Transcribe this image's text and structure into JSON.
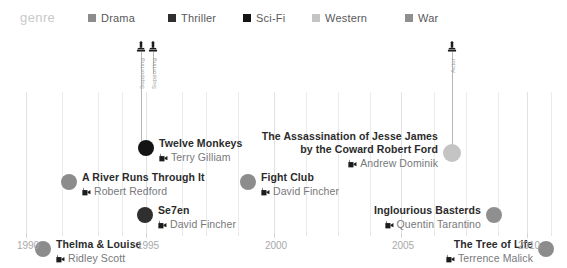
{
  "legend": {
    "title": "genre",
    "items": [
      {
        "label": "Drama",
        "color": "#8c8c8c",
        "x": 88
      },
      {
        "label": "Thriller",
        "color": "#2f2f2f",
        "x": 168
      },
      {
        "label": "Sci-Fi",
        "color": "#141414",
        "x": 243
      },
      {
        "label": "Western",
        "color": "#c4c4c4",
        "x": 312
      },
      {
        "label": "War",
        "color": "#8f8f8f",
        "x": 405
      }
    ]
  },
  "axis": {
    "label": "",
    "ticks": [
      {
        "label": "1990",
        "x": 26
      },
      {
        "label": "1995",
        "x": 146
      },
      {
        "label": "2000",
        "x": 274
      },
      {
        "label": "2005",
        "x": 401
      },
      {
        "label": "2010",
        "x": 527
      }
    ],
    "minor_x": [
      62,
      98,
      122,
      182,
      206,
      238,
      306,
      338,
      370,
      434,
      466,
      498,
      551
    ]
  },
  "chart_data": {
    "type": "scatter",
    "title": "",
    "xlabel": "",
    "ylabel": "",
    "xlim": [
      1990,
      2011
    ],
    "grid": true,
    "legend_position": "top",
    "films": [
      {
        "title": "Twelve Monkeys",
        "director": "Terry Gilliam",
        "genre": "Sci-Fi",
        "color": "#141414",
        "x": 146,
        "y": 114,
        "r": 8,
        "side": "right",
        "awards": [
          {
            "text": "Supporting",
            "x": 141,
            "stem_top": 18,
            "stem_bottom": 114
          },
          {
            "text": "Supporting",
            "x": 153,
            "stem_top": 18,
            "stem_bottom": 40
          }
        ]
      },
      {
        "title": "A River Runs Through It",
        "director": "Robert Redford",
        "genre": "Drama",
        "color": "#8c8c8c",
        "x": 69,
        "y": 148,
        "r": 8,
        "side": "right",
        "awards": []
      },
      {
        "title": "Se7en",
        "director": "David Fincher",
        "genre": "Thriller",
        "color": "#2f2f2f",
        "x": 145,
        "y": 181,
        "r": 8,
        "side": "right",
        "awards": []
      },
      {
        "title": "Thelma & Louise",
        "director": "Ridley Scott",
        "genre": "Drama",
        "color": "#8c8c8c",
        "x": 43,
        "y": 215,
        "r": 8,
        "side": "right",
        "awards": []
      },
      {
        "title": "Fight Club",
        "director": "David Fincher",
        "genre": "Drama",
        "color": "#8c8c8c",
        "x": 248,
        "y": 148,
        "r": 8,
        "side": "right",
        "awards": []
      },
      {
        "title": "The Assassination of Jesse James",
        "title2": "by the Coward Robert Ford",
        "director": "Andrew Dominik",
        "genre": "Western",
        "color": "#c4c4c4",
        "x": 452,
        "y": 119,
        "r": 9,
        "side": "left",
        "awards": [
          {
            "text": "Actor",
            "x": 452,
            "stem_top": 18,
            "stem_bottom": 119
          }
        ]
      },
      {
        "title": "Inglourious Basterds",
        "director": "Quentin Tarantino",
        "genre": "War",
        "color": "#8f8f8f",
        "x": 494,
        "y": 181,
        "r": 8,
        "side": "left",
        "awards": []
      },
      {
        "title": "The Tree of Life",
        "director": "Terrence Malick",
        "genre": "Drama",
        "color": "#8c8c8c",
        "x": 546,
        "y": 215,
        "r": 8,
        "side": "left",
        "awards": []
      }
    ]
  }
}
